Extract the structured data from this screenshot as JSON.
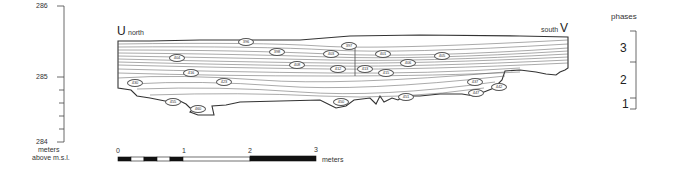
{
  "elevation_axis": {
    "ticks": [
      {
        "label": "286",
        "y": 6
      },
      {
        "label": "285",
        "y": 77
      },
      {
        "label": "284",
        "y": 141
      }
    ],
    "unit_line1": "meters",
    "unit_line2": "above  m.s.l."
  },
  "section": {
    "left_marker": "U",
    "left_direction": "north",
    "right_marker": "V",
    "right_direction": "south",
    "loci": [
      {
        "id": "396",
        "x": 245,
        "y": 41
      },
      {
        "id": "397",
        "x": 348,
        "y": 45
      },
      {
        "id": "398",
        "x": 276,
        "y": 51
      },
      {
        "id": "403",
        "x": 330,
        "y": 53
      },
      {
        "id": "401",
        "x": 382,
        "y": 53
      },
      {
        "id": "405",
        "x": 441,
        "y": 55
      },
      {
        "id": "404",
        "x": 176,
        "y": 57
      },
      {
        "id": "408",
        "x": 296,
        "y": 64
      },
      {
        "id": "406",
        "x": 407,
        "y": 62
      },
      {
        "id": "412",
        "x": 337,
        "y": 68
      },
      {
        "id": "413",
        "x": 364,
        "y": 68
      },
      {
        "id": "415",
        "x": 385,
        "y": 72
      },
      {
        "id": "416",
        "x": 190,
        "y": 72
      },
      {
        "id": "423",
        "x": 223,
        "y": 81
      },
      {
        "id": "430",
        "x": 134,
        "y": 82
      },
      {
        "id": "437",
        "x": 474,
        "y": 81
      },
      {
        "id": "442",
        "x": 498,
        "y": 86
      },
      {
        "id": "447",
        "x": 475,
        "y": 92
      },
      {
        "id": "451",
        "x": 405,
        "y": 96
      },
      {
        "id": "450",
        "x": 340,
        "y": 101
      },
      {
        "id": "455",
        "x": 172,
        "y": 101
      },
      {
        "id": "460",
        "x": 197,
        "y": 108
      }
    ]
  },
  "phases": {
    "title": "phases",
    "items": [
      {
        "label": "3",
        "y": 47
      },
      {
        "label": "2",
        "y": 79
      },
      {
        "label": "1",
        "y": 101
      }
    ]
  },
  "scale_bar": {
    "labels": [
      {
        "text": "0",
        "x": 118
      },
      {
        "text": "1",
        "x": 183
      },
      {
        "text": "2",
        "x": 250
      },
      {
        "text": "3",
        "x": 316
      }
    ],
    "unit": "meters"
  }
}
